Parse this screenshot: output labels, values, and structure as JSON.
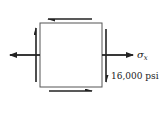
{
  "diagram": {
    "type": "stress-element",
    "element": {
      "x": 40,
      "y": 23,
      "width": 62,
      "height": 64
    },
    "normal_stress": {
      "label": "σ",
      "subscript": "x",
      "direction": "tension (outward, horizontal)"
    },
    "shear_stress": {
      "label": "16,000 psi",
      "top_arrow": "left",
      "bottom_arrow": "right",
      "left_arrow": "up",
      "right_arrow": "down"
    },
    "colors": {
      "stroke": "#222222",
      "element_border": "#555555",
      "background": "#ffffff"
    }
  }
}
